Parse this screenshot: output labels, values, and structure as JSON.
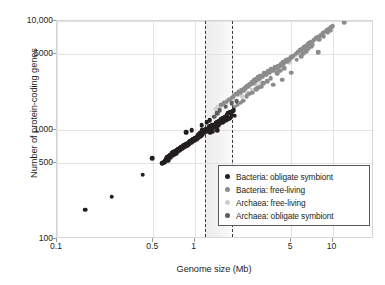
{
  "chart_data": {
    "type": "scatter",
    "title": "",
    "xlabel": "Genome size (Mb)",
    "ylabel": "Number of protein-coding genes",
    "xscale": "log",
    "yscale": "log",
    "xlim": [
      0.1,
      20
    ],
    "ylim": [
      100,
      10000
    ],
    "xticks": [
      0.1,
      0.5,
      1,
      5,
      10
    ],
    "xtick_labels": [
      "0.1",
      "0.5",
      "1",
      "5",
      "10"
    ],
    "yticks": [
      100,
      500,
      1000,
      5000,
      10000
    ],
    "ytick_labels": [
      "100",
      "500",
      "1000",
      "5000",
      "10,000"
    ],
    "grid": true,
    "legend_position": "lower right",
    "annotations": {
      "shaded_band": {
        "x_start": 1.18,
        "x_end": 1.85,
        "label": ""
      },
      "dashed_lines": [
        1.18,
        1.85
      ]
    },
    "series": [
      {
        "name": "Bacteria: obligate symbiont",
        "color": "#231f20",
        "points": [
          [
            0.16,
            185
          ],
          [
            0.25,
            245
          ],
          [
            0.42,
            390
          ],
          [
            0.49,
            550
          ],
          [
            0.58,
            495
          ],
          [
            0.6,
            505
          ],
          [
            0.61,
            520
          ],
          [
            0.62,
            540
          ],
          [
            0.63,
            560
          ],
          [
            0.64,
            530
          ],
          [
            0.65,
            575
          ],
          [
            0.66,
            595
          ],
          [
            0.67,
            560
          ],
          [
            0.68,
            610
          ],
          [
            0.69,
            585
          ],
          [
            0.7,
            625
          ],
          [
            0.71,
            600
          ],
          [
            0.72,
            640
          ],
          [
            0.73,
            615
          ],
          [
            0.74,
            655
          ],
          [
            0.75,
            630
          ],
          [
            0.76,
            670
          ],
          [
            0.77,
            645
          ],
          [
            0.78,
            690
          ],
          [
            0.79,
            660
          ],
          [
            0.8,
            700
          ],
          [
            0.81,
            680
          ],
          [
            0.82,
            715
          ],
          [
            0.83,
            695
          ],
          [
            0.84,
            730
          ],
          [
            0.85,
            705
          ],
          [
            0.86,
            745
          ],
          [
            0.87,
            955
          ],
          [
            0.88,
            720
          ],
          [
            0.89,
            760
          ],
          [
            0.9,
            735
          ],
          [
            0.91,
            775
          ],
          [
            0.92,
            750
          ],
          [
            0.93,
            790
          ],
          [
            0.94,
            765
          ],
          [
            0.95,
            805
          ],
          [
            0.96,
            780
          ],
          [
            0.97,
            820
          ],
          [
            0.98,
            795
          ],
          [
            0.99,
            835
          ],
          [
            1.0,
            810
          ],
          [
            1.01,
            850
          ],
          [
            1.02,
            825
          ],
          [
            1.03,
            865
          ],
          [
            1.04,
            840
          ],
          [
            1.05,
            880
          ],
          [
            1.06,
            900
          ],
          [
            1.07,
            860
          ],
          [
            1.08,
            915
          ],
          [
            1.09,
            880
          ],
          [
            1.1,
            935
          ],
          [
            1.11,
            900
          ],
          [
            1.12,
            955
          ],
          [
            1.13,
            990
          ],
          [
            1.14,
            920
          ],
          [
            1.15,
            975
          ],
          [
            1.16,
            1010
          ],
          [
            1.17,
            945
          ],
          [
            1.18,
            995
          ],
          [
            1.2,
            1030
          ],
          [
            1.22,
            965
          ],
          [
            1.24,
            1010
          ],
          [
            1.26,
            1060
          ],
          [
            1.28,
            1005
          ],
          [
            1.3,
            1080
          ],
          [
            1.32,
            1030
          ],
          [
            1.34,
            1100
          ],
          [
            1.36,
            1055
          ],
          [
            1.38,
            1120
          ],
          [
            1.4,
            1070
          ],
          [
            1.42,
            1150
          ],
          [
            1.44,
            1090
          ],
          [
            1.46,
            1180
          ],
          [
            1.48,
            1110
          ],
          [
            1.5,
            1210
          ],
          [
            1.52,
            1140
          ],
          [
            1.55,
            1250
          ],
          [
            1.58,
            1170
          ],
          [
            1.6,
            1290
          ],
          [
            1.62,
            1200
          ],
          [
            1.65,
            1330
          ],
          [
            1.68,
            1230
          ],
          [
            1.7,
            1370
          ],
          [
            1.72,
            1260
          ],
          [
            1.75,
            1420
          ],
          [
            1.78,
            1290
          ],
          [
            1.8,
            1460
          ],
          [
            1.3,
            960
          ],
          [
            1.35,
            975
          ],
          [
            1.45,
            990
          ],
          [
            0.95,
            1000
          ],
          [
            1.82,
            1300
          ],
          [
            1.85,
            1380
          ],
          [
            1.88,
            1480
          ],
          [
            1.92,
            1510
          ],
          [
            1.95,
            1350
          ],
          [
            1.22,
            1180
          ],
          [
            1.28,
            1230
          ],
          [
            1.12,
            1100
          ]
        ]
      },
      {
        "name": "Bacteria: free-living",
        "color": "#8c8c8c",
        "points": [
          [
            0.86,
            950
          ],
          [
            1.55,
            1700
          ],
          [
            1.62,
            1760
          ],
          [
            1.7,
            1820
          ],
          [
            1.78,
            1900
          ],
          [
            1.85,
            1980
          ],
          [
            1.92,
            2050
          ],
          [
            2.0,
            2150
          ],
          [
            2.05,
            2100
          ],
          [
            2.1,
            2250
          ],
          [
            2.15,
            2200
          ],
          [
            2.2,
            2350
          ],
          [
            2.25,
            2300
          ],
          [
            2.3,
            2450
          ],
          [
            2.35,
            2400
          ],
          [
            2.4,
            2550
          ],
          [
            2.45,
            2500
          ],
          [
            2.5,
            2650
          ],
          [
            2.55,
            2600
          ],
          [
            2.6,
            2750
          ],
          [
            2.65,
            2700
          ],
          [
            2.7,
            2850
          ],
          [
            2.75,
            2800
          ],
          [
            2.8,
            2950
          ],
          [
            2.85,
            2900
          ],
          [
            2.9,
            3050
          ],
          [
            2.95,
            3000
          ],
          [
            3.0,
            3150
          ],
          [
            3.1,
            3100
          ],
          [
            3.2,
            3300
          ],
          [
            3.3,
            3250
          ],
          [
            3.4,
            3450
          ],
          [
            3.5,
            3400
          ],
          [
            3.6,
            3600
          ],
          [
            3.7,
            3550
          ],
          [
            3.8,
            3750
          ],
          [
            3.9,
            3700
          ],
          [
            4.0,
            3900
          ],
          [
            4.1,
            3850
          ],
          [
            4.2,
            4050
          ],
          [
            4.3,
            4000
          ],
          [
            4.4,
            4200
          ],
          [
            4.5,
            4150
          ],
          [
            4.6,
            4350
          ],
          [
            4.7,
            4300
          ],
          [
            4.8,
            4500
          ],
          [
            4.9,
            4450
          ],
          [
            5.0,
            4650
          ],
          [
            5.2,
            4800
          ],
          [
            5.4,
            5000
          ],
          [
            5.6,
            5200
          ],
          [
            5.8,
            5400
          ],
          [
            6.0,
            5550
          ],
          [
            6.2,
            5750
          ],
          [
            6.4,
            5900
          ],
          [
            6.6,
            6100
          ],
          [
            6.8,
            6250
          ],
          [
            7.0,
            6450
          ],
          [
            7.3,
            6700
          ],
          [
            7.6,
            6950
          ],
          [
            7.9,
            7200
          ],
          [
            8.2,
            7450
          ],
          [
            8.5,
            7700
          ],
          [
            8.8,
            7950
          ],
          [
            9.1,
            8250
          ],
          [
            9.4,
            8500
          ],
          [
            9.7,
            8750
          ],
          [
            10.0,
            9000
          ],
          [
            12.2,
            9750
          ],
          [
            7.9,
            5200
          ],
          [
            4.3,
            2900
          ],
          [
            3.7,
            2600
          ],
          [
            2.05,
            1700
          ],
          [
            2.15,
            1780
          ],
          [
            2.25,
            1850
          ],
          [
            1.95,
            1640
          ],
          [
            5.0,
            3350
          ],
          [
            2.6,
            2200
          ],
          [
            2.8,
            2380
          ],
          [
            3.05,
            2500
          ],
          [
            3.35,
            2800
          ],
          [
            3.55,
            3000
          ],
          [
            3.95,
            3300
          ],
          [
            4.45,
            3700
          ],
          [
            6.1,
            5050
          ],
          [
            6.7,
            5600
          ],
          [
            7.2,
            6050
          ],
          [
            8.0,
            6800
          ],
          [
            8.6,
            7250
          ],
          [
            9.2,
            7800
          ],
          [
            9.6,
            8200
          ],
          [
            2.38,
            2050
          ],
          [
            2.48,
            2150
          ],
          [
            2.9,
            2450
          ],
          [
            3.15,
            2700
          ],
          [
            4.15,
            3500
          ],
          [
            5.5,
            4400
          ],
          [
            5.9,
            4750
          ],
          [
            6.45,
            5300
          ],
          [
            7.05,
            5800
          ]
        ]
      },
      {
        "name": "Archaea: free-living",
        "color": "#cfcfcf",
        "points": [
          [
            1.48,
            1620
          ],
          [
            1.55,
            1680
          ],
          [
            1.6,
            1730
          ],
          [
            1.66,
            1800
          ],
          [
            1.72,
            1860
          ],
          [
            1.8,
            1940
          ],
          [
            1.88,
            2020
          ],
          [
            1.95,
            2100
          ],
          [
            2.02,
            2180
          ],
          [
            2.1,
            2260
          ],
          [
            2.18,
            2340
          ],
          [
            2.26,
            2420
          ],
          [
            2.35,
            2500
          ],
          [
            2.45,
            2580
          ],
          [
            2.55,
            2660
          ],
          [
            2.65,
            2740
          ],
          [
            2.75,
            2820
          ],
          [
            2.88,
            2900
          ],
          [
            3.0,
            3000
          ],
          [
            3.15,
            3120
          ],
          [
            3.3,
            3250
          ],
          [
            3.5,
            3400
          ],
          [
            3.7,
            3550
          ],
          [
            3.95,
            3750
          ],
          [
            4.2,
            3950
          ],
          [
            4.5,
            4150
          ],
          [
            4.8,
            4400
          ],
          [
            5.1,
            4650
          ],
          [
            5.5,
            4900
          ],
          [
            5.9,
            5200
          ],
          [
            6.3,
            5500
          ],
          [
            6.8,
            5850
          ],
          [
            2.2,
            2050
          ],
          [
            2.4,
            2200
          ],
          [
            2.6,
            2350
          ],
          [
            2.85,
            2560
          ],
          [
            3.05,
            2700
          ],
          [
            1.42,
            1560
          ],
          [
            1.52,
            1620
          ],
          [
            1.68,
            1720
          ],
          [
            1.9,
            1880
          ],
          [
            4.0,
            3500
          ],
          [
            4.4,
            3800
          ],
          [
            4.9,
            4200
          ]
        ]
      },
      {
        "name": "Archaea: obligate symbiont",
        "color": "#5d5d5d",
        "points": [
          [
            1.85,
            1760
          ],
          [
            1.68,
            1640
          ],
          [
            1.52,
            1520
          ],
          [
            1.45,
            1420
          ],
          [
            1.38,
            1330
          ],
          [
            2.02,
            1840
          ]
        ]
      }
    ]
  },
  "axis": {
    "xlabel": "Genome size (Mb)",
    "ylabel": "Number of protein-coding genes",
    "xtick_labels": [
      "0.1",
      "0.5",
      "1",
      "5",
      "10"
    ],
    "ytick_labels": [
      "100",
      "500",
      "1000",
      "5000",
      "10,000"
    ]
  },
  "legend": {
    "entries": [
      {
        "label": "Bacteria: obligate symbiont",
        "color": "#231f20"
      },
      {
        "label": "Bacteria: free-living",
        "color": "#8c8c8c"
      },
      {
        "label": "Archaea: free-living",
        "color": "#cfcfcf"
      },
      {
        "label": "Archaea: obligate symbiont",
        "color": "#5d5d5d"
      }
    ]
  },
  "colors": {
    "bacteria_obligate": "#231f20",
    "bacteria_free": "#8c8c8c",
    "archaea_free": "#cfcfcf",
    "archaea_obligate": "#5d5d5d",
    "grid": "#e3e3e3",
    "frame": "#d6d6d6",
    "band": "#ebebeb",
    "dash": "#3a3a3a",
    "text": "#231f20"
  }
}
